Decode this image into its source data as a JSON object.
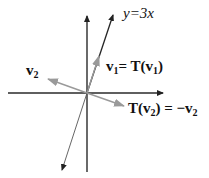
{
  "diagram": {
    "type": "linear-transformation-reflection",
    "line_label": "y=3x",
    "vectors": {
      "v1": {
        "name": "v",
        "sub": "1",
        "label_eq": "= T(v",
        "label_sub": "1",
        "label_close": ")"
      },
      "v2": {
        "name": "v",
        "sub": "2"
      },
      "Tv2": {
        "prefix": "T(v",
        "sub": "2",
        "mid": ") = −v",
        "sub2": "2"
      }
    },
    "colors": {
      "axes": "#2a2a2a",
      "line": "#222222",
      "vector": "#9a9a9a",
      "text": "#111111"
    }
  }
}
